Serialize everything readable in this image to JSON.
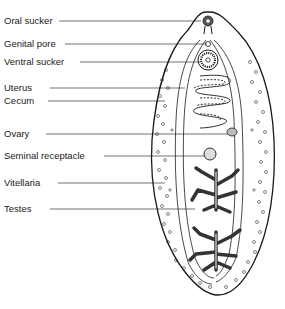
{
  "diagram": {
    "labels": [
      {
        "id": "oral-sucker",
        "text": "Oral sucker",
        "y": 21,
        "line_x1": 59,
        "line_x2": 201
      },
      {
        "id": "genital-pore",
        "text": "Genital pore",
        "y": 44,
        "line_x1": 65,
        "line_x2": 207
      },
      {
        "id": "ventral-sucker",
        "text": "Ventral sucker",
        "y": 62,
        "line_x1": 80,
        "line_x2": 200
      },
      {
        "id": "uterus",
        "text": "Uterus",
        "y": 88,
        "line_x1": 50,
        "line_x2": 185
      },
      {
        "id": "cecum",
        "text": "Cecum",
        "y": 101,
        "line_x1": 48,
        "line_x2": 165
      },
      {
        "id": "ovary",
        "text": "Ovary",
        "y": 134,
        "line_x1": 46,
        "line_x2": 232
      },
      {
        "id": "seminal-receptacle",
        "text": "Seminal receptacle",
        "y": 156,
        "line_x1": 104,
        "line_x2": 206
      },
      {
        "id": "vitellaria",
        "text": "Vitellaria",
        "y": 183,
        "line_x1": 58,
        "line_x2": 165
      },
      {
        "id": "testes",
        "text": "Testes",
        "y": 209,
        "line_x1": 50,
        "line_x2": 195
      }
    ],
    "colors": {
      "ink": "#1a1a1a",
      "background": "#ffffff",
      "stipple": "#9a9a9a"
    }
  }
}
